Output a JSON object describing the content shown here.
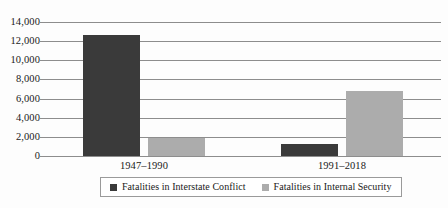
{
  "chart_data": {
    "type": "bar",
    "title": "",
    "subtitle": "",
    "xlabel": "",
    "ylabel": "",
    "categories": [
      "1947–1990",
      "1991–2018"
    ],
    "series": [
      {
        "name": "Fatalities in Interstate Conflict",
        "color": "#3a3a3a",
        "values": [
          12600,
          1300
        ]
      },
      {
        "name": "Fatalities in Internal Security",
        "color": "#acacac",
        "values": [
          1900,
          6800
        ]
      }
    ],
    "ylim": [
      0,
      14000
    ],
    "ytick_values": [
      0,
      2000,
      4000,
      6000,
      8000,
      10000,
      12000,
      14000
    ],
    "ytick_labels": [
      "0",
      "2,000",
      "4,000",
      "6,000",
      "8,000",
      "10,000",
      "12,000",
      "14,000"
    ],
    "grid": true,
    "grid_axis": "y",
    "legend_position": "bottom",
    "legend_border": true
  },
  "colors": {
    "series_dark": "#3a3a3a",
    "series_light": "#acacac",
    "gridline": "#8d8d8d",
    "text": "#1a1a1a",
    "background": "#fdfdfd",
    "legend_border": "#9a9a9a"
  }
}
